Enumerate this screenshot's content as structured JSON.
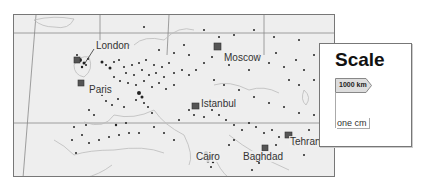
{
  "map": {
    "title": "Europe and Middle East population map",
    "cities": [
      {
        "name": "London",
        "x": 81,
        "y": 26
      },
      {
        "name": "Paris",
        "x": 76,
        "y": 69
      },
      {
        "name": "Moscow",
        "x": 210,
        "y": 38
      },
      {
        "name": "Istanbul",
        "x": 188,
        "y": 84
      },
      {
        "name": "Cairo",
        "x": 182,
        "y": 134
      },
      {
        "name": "Baghdad",
        "x": 229,
        "y": 135
      },
      {
        "name": "Tehran",
        "x": 275,
        "y": 122
      }
    ],
    "colors": {
      "land": "#eeeeee",
      "border": "#777777",
      "dot": "#222222",
      "city_marker": "#555555"
    }
  },
  "legend": {
    "title": "Scale",
    "distance_label": "1000 km",
    "unit_label": "one cm"
  }
}
